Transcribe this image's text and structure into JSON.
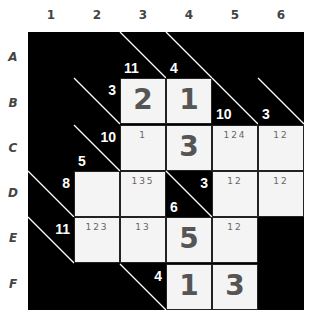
{
  "puzzle": {
    "type": "kakuro",
    "column_labels": [
      "1",
      "2",
      "3",
      "4",
      "5",
      "6"
    ],
    "row_labels": [
      "A",
      "B",
      "C",
      "D",
      "E",
      "F"
    ],
    "colors": {
      "block": "#000000",
      "cell": "#f4f4f4",
      "digit": "#555555",
      "clue": "#ffffff"
    },
    "cells": {
      "A3": {
        "type": "clue",
        "down": "11",
        "across": null
      },
      "A4": {
        "type": "clue",
        "down": "4",
        "across": null
      },
      "B2": {
        "type": "clue",
        "down": null,
        "across": "3"
      },
      "B3": {
        "type": "white",
        "value": "2"
      },
      "B4": {
        "type": "white",
        "value": "1"
      },
      "B5": {
        "type": "clue",
        "down": "10",
        "across": null
      },
      "B6": {
        "type": "clue",
        "down": "3",
        "across": null
      },
      "C2": {
        "type": "clue",
        "down": "5",
        "across": "10"
      },
      "C3": {
        "type": "white",
        "pencil": "1"
      },
      "C4": {
        "type": "white",
        "value": "3"
      },
      "C5": {
        "type": "white",
        "pencil": "124"
      },
      "C6": {
        "type": "white",
        "pencil": "12"
      },
      "D1": {
        "type": "clue",
        "down": null,
        "across": "8"
      },
      "D2": {
        "type": "white"
      },
      "D3": {
        "type": "white",
        "pencil": "135"
      },
      "D4": {
        "type": "clue",
        "down": "6",
        "across": "3"
      },
      "D5": {
        "type": "white",
        "pencil": "12"
      },
      "D6": {
        "type": "white",
        "pencil": "12"
      },
      "E1": {
        "type": "clue",
        "down": null,
        "across": "11"
      },
      "E2": {
        "type": "white",
        "pencil": "123"
      },
      "E3": {
        "type": "white",
        "pencil": "13"
      },
      "E4": {
        "type": "white",
        "value": "5"
      },
      "E5": {
        "type": "white",
        "pencil": "12"
      },
      "F3": {
        "type": "clue",
        "down": null,
        "across": "4"
      },
      "F4": {
        "type": "white",
        "value": "1"
      },
      "F5": {
        "type": "white",
        "value": "3"
      }
    }
  }
}
